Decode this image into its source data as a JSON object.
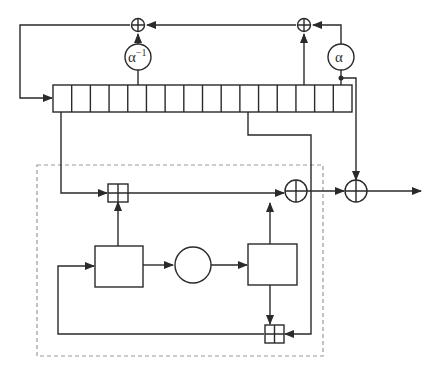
{
  "diagram": {
    "type": "block-diagram",
    "colors": {
      "line": "#2a2a2a",
      "dashed_border": "#9a9a9a",
      "background": "#ffffff"
    },
    "register": {
      "cell_count": 16
    },
    "multipliers": [
      {
        "id": "alpha-inverse",
        "label": "α",
        "superscript": "−1"
      },
      {
        "id": "alpha",
        "label": "α",
        "superscript": ""
      }
    ],
    "xor_nodes": [
      {
        "id": "xor-top-left"
      },
      {
        "id": "xor-top-right"
      },
      {
        "id": "xor-fsm-output"
      },
      {
        "id": "xor-keystream"
      }
    ],
    "modular_adders": [
      {
        "id": "boxplus-top"
      },
      {
        "id": "boxplus-bottom"
      }
    ],
    "fsm": {
      "blocks": [
        {
          "id": "register-r1",
          "label": ""
        },
        {
          "id": "sbox-circle",
          "label": ""
        },
        {
          "id": "register-r2",
          "label": ""
        }
      ]
    }
  }
}
